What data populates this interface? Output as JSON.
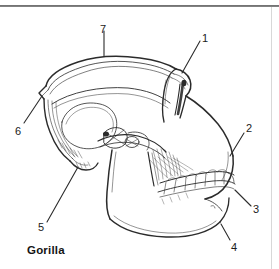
{
  "figure": {
    "caption": "Gorilla",
    "ink_color": "#2b2b2b",
    "background_color": "#ffffff",
    "rule_color": "#5a5a5a"
  },
  "labels": [
    {
      "id": "1",
      "text": "1",
      "x": 202,
      "y": 33
    },
    {
      "id": "2",
      "text": "2",
      "x": 246,
      "y": 123
    },
    {
      "id": "3",
      "text": "3",
      "x": 253,
      "y": 204
    },
    {
      "id": "4",
      "text": "4",
      "x": 231,
      "y": 242
    },
    {
      "id": "5",
      "text": "5",
      "x": 38,
      "y": 222
    },
    {
      "id": "6",
      "text": "6",
      "x": 15,
      "y": 126
    },
    {
      "id": "7",
      "text": "7",
      "x": 100,
      "y": 24
    }
  ]
}
